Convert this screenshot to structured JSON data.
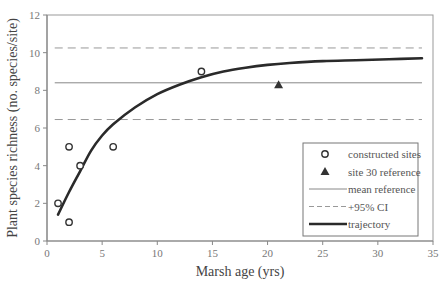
{
  "chart_data": {
    "type": "scatter",
    "title": "",
    "xlabel": "Marsh age (yrs)",
    "ylabel": "Plant species richness (no. species/site)",
    "xlim": [
      0,
      35
    ],
    "ylim": [
      0,
      12
    ],
    "x_ticks": [
      0,
      5,
      10,
      15,
      20,
      25,
      30,
      35
    ],
    "y_ticks": [
      0,
      2,
      4,
      6,
      8,
      10,
      12
    ],
    "grid": false,
    "legend_position": "lower right",
    "series": [
      {
        "name": "constructed sites",
        "type": "scatter",
        "marker": "open-circle",
        "points": [
          [
            1,
            2
          ],
          [
            2,
            5
          ],
          [
            2,
            1
          ],
          [
            3,
            4
          ],
          [
            6,
            5
          ],
          [
            14,
            9
          ]
        ]
      },
      {
        "name": "site 30 reference",
        "type": "scatter",
        "marker": "filled-triangle",
        "points": [
          [
            21,
            8.3
          ]
        ]
      },
      {
        "name": "mean reference",
        "type": "hline",
        "style": "thin-solid",
        "y": 8.4,
        "x_range": [
          0.7,
          34
        ]
      },
      {
        "name": "+95% CI",
        "type": "hline",
        "style": "dashed",
        "y_values": [
          10.25,
          6.45
        ],
        "x_range": [
          0.7,
          34
        ]
      },
      {
        "name": "trajectory",
        "type": "line",
        "style": "thick-solid",
        "points": [
          [
            1,
            1.4
          ],
          [
            2,
            2.6
          ],
          [
            3,
            3.7
          ],
          [
            4,
            4.8
          ],
          [
            5,
            5.6
          ],
          [
            6,
            6.2
          ],
          [
            8,
            7.1
          ],
          [
            10,
            7.8
          ],
          [
            12,
            8.3
          ],
          [
            14,
            8.7
          ],
          [
            16,
            9.0
          ],
          [
            18,
            9.2
          ],
          [
            20,
            9.35
          ],
          [
            22,
            9.45
          ],
          [
            25,
            9.55
          ],
          [
            28,
            9.6
          ],
          [
            31,
            9.65
          ],
          [
            34,
            9.7
          ]
        ]
      }
    ]
  },
  "legend": {
    "items": [
      {
        "label": "constructed sites",
        "symbol": "open-circle"
      },
      {
        "label": "site 30 reference",
        "symbol": "filled-triangle"
      },
      {
        "label": "mean reference",
        "symbol": "thin-line"
      },
      {
        "label": "+95% CI",
        "symbol": "dashed-line"
      },
      {
        "label": "trajectory",
        "symbol": "thick-line"
      }
    ]
  },
  "colors": {
    "axis": "#888888",
    "frame": "#999999",
    "markers": "#333333",
    "ref_line": "#888888",
    "ci_line": "#999999",
    "trajectory": "#2a2a2a"
  }
}
